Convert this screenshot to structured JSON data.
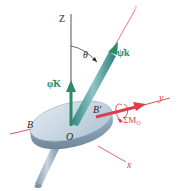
{
  "diagram": {
    "labels": {
      "Z_axis": "Z",
      "z_axis": "z",
      "y_axis": "y",
      "x_axis": "x",
      "theta": "θ",
      "spin": "ψ̇k",
      "precession": "φ̇K",
      "point_B": "B",
      "point_B_prime": "B′",
      "origin": "O",
      "moment": "ΣM",
      "moment_sub": "O"
    },
    "colors": {
      "axis_black": "#2a2a2a",
      "axis_red": "#d9404a",
      "vector_green": "#2e8b6a",
      "shaft_teal": "#4a9a9a",
      "disk_top": "#c9d9e6",
      "disk_edge": "#8fa6b8",
      "label_red": "#d9404a",
      "label_green": "#2e8b6a"
    }
  }
}
